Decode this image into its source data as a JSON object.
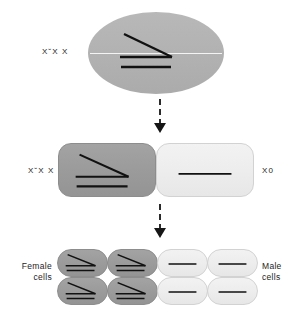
{
  "figure": {
    "type": "biology-diagram",
    "title_visible": false,
    "colors": {
      "background": "#ffffff",
      "dark_cell": "#9b9b9b",
      "light_cell": "#ededed",
      "chromosome_line": "#111111",
      "arrow": "#161616",
      "text": "#1d1d1d"
    }
  },
  "rows": {
    "zygote": {
      "label": "X˘X X",
      "cell_shade": "dark",
      "chromosomes": "two-x-plus-diagonal"
    },
    "division": {
      "left": {
        "label": "X˘X X",
        "cell_shade": "dark",
        "chromosomes": "two-x-plus-diagonal"
      },
      "right": {
        "label": "X0",
        "cell_shade": "light",
        "chromosomes": "single-x"
      }
    },
    "daughters": {
      "left_label": "Female\ncells",
      "right_label": "Male\ncells",
      "female_cells": [
        {
          "shade": "dark",
          "chromosomes": "two-x-plus-diagonal"
        },
        {
          "shade": "dark",
          "chromosomes": "two-x-plus-diagonal"
        },
        {
          "shade": "dark",
          "chromosomes": "two-x-plus-diagonal"
        },
        {
          "shade": "dark",
          "chromosomes": "two-x-plus-diagonal"
        }
      ],
      "male_cells": [
        {
          "shade": "light",
          "chromosomes": "single-x"
        },
        {
          "shade": "light",
          "chromosomes": "single-x"
        },
        {
          "shade": "light",
          "chromosomes": "single-x"
        },
        {
          "shade": "light",
          "chromosomes": "single-x"
        }
      ]
    }
  },
  "arrows": [
    {
      "name": "arrow-zygote-to-division",
      "style": "dashed-down"
    },
    {
      "name": "arrow-division-to-daughters",
      "style": "dashed-down"
    }
  ]
}
